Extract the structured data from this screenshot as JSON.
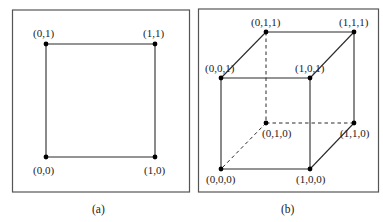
{
  "figure": {
    "panels": [
      {
        "id": "a",
        "caption": "(a)",
        "shape": "square",
        "vertices": [
          {
            "label": "(0,1)",
            "x": 46,
            "y": 44
          },
          {
            "label": "(1,1)",
            "x": 155,
            "y": 44
          },
          {
            "label": "(0,0)",
            "x": 46,
            "y": 157
          },
          {
            "label": "(1,0)",
            "x": 155,
            "y": 157
          }
        ]
      },
      {
        "id": "b",
        "caption": "(b)",
        "shape": "cube",
        "vertices": [
          {
            "label": "(0,1,1)",
            "x": 266,
            "y": 32
          },
          {
            "label": "(1,1,1)",
            "x": 354,
            "y": 32
          },
          {
            "label": "(0,0,1)",
            "x": 221,
            "y": 78
          },
          {
            "label": "(1,0,1)",
            "x": 310,
            "y": 78
          },
          {
            "label": "(0,1,0)",
            "x": 266,
            "y": 123
          },
          {
            "label": "(1,1,0)",
            "x": 354,
            "y": 123
          },
          {
            "label": "(0,0,0)",
            "x": 221,
            "y": 169
          },
          {
            "label": "(1,0,0)",
            "x": 310,
            "y": 169
          }
        ],
        "hidden_edges": [
          "(0,1,0)-(0,1,1)",
          "(0,1,0)-(1,1,0)",
          "(0,1,0)-(0,0,0)"
        ]
      }
    ],
    "colors": {
      "line": "#2a2a2a",
      "frame": "#555555",
      "dot": "#000000"
    }
  }
}
